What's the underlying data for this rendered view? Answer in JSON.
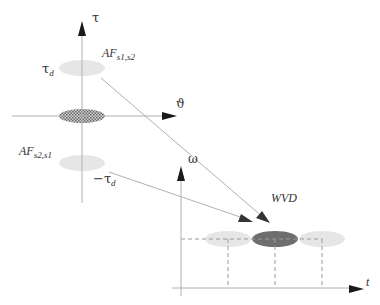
{
  "diagram": {
    "ambiguity_plane": {
      "tau_axis_label": "τ",
      "theta_axis_label": "ϑ",
      "tau_d_label": "τ",
      "tau_d_sub": "d",
      "neg_tau_d_label": "−τ",
      "neg_tau_d_sub": "d",
      "af_s1s2_main": "AF",
      "af_s1s2_sub": "s1,s2",
      "af_s2s1_main": "AF",
      "af_s2s1_sub": "s2,s1"
    },
    "tf_plane": {
      "omega_axis_label": "ω",
      "t_axis_label": "t",
      "wvd_label": "WVD"
    },
    "colors": {
      "axis": "#b0b0b0",
      "arrow": "#1a1a1a",
      "light_ellipse": "#e6e6e6",
      "dark_ellipse": "#6e6e6e",
      "hatched_ellipse": "#8a8a8a",
      "dashed": "#999999"
    }
  }
}
